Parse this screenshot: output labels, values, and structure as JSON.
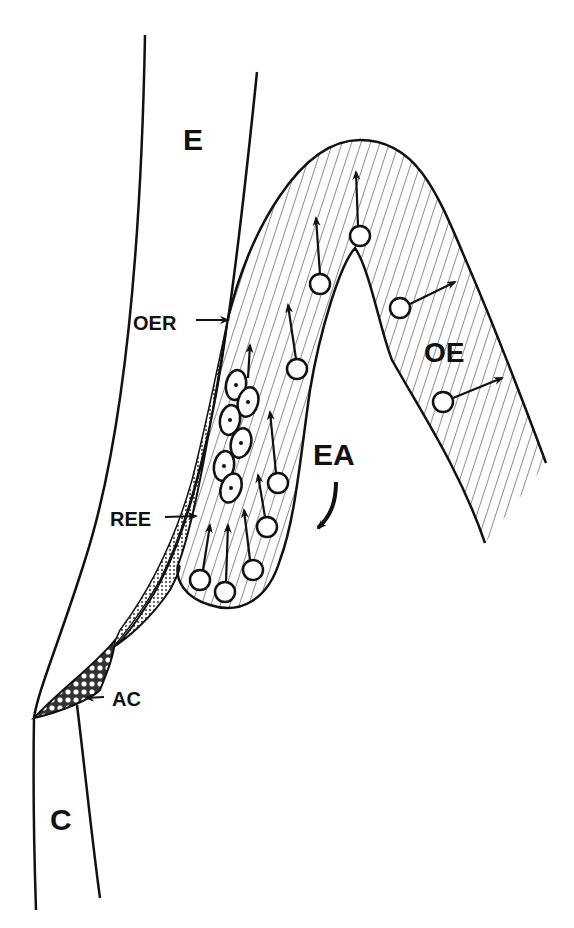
{
  "figure": {
    "type": "tooth-development-schematic",
    "labels": {
      "E": "E",
      "OER": "OER",
      "OE": "OE",
      "EA": "EA",
      "REE": "REE",
      "AC": "AC",
      "C": "C"
    },
    "colors": {
      "ink": "#111111",
      "background": "#ffffff"
    },
    "regions": [
      {
        "id": "E",
        "label": "E"
      },
      {
        "id": "OE",
        "label": "OE"
      },
      {
        "id": "EA",
        "label": "EA"
      },
      {
        "id": "REE",
        "label": "REE"
      },
      {
        "id": "AC",
        "label": "AC"
      },
      {
        "id": "C",
        "label": "C"
      }
    ]
  }
}
